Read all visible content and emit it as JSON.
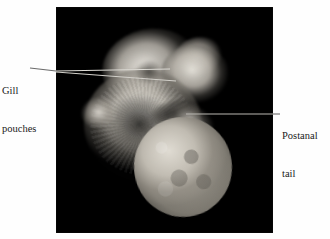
{
  "figure": {
    "background_color": "#fefefe",
    "panel": {
      "name": "embryo-photograph",
      "background_color": "#000000",
      "subject": "vertebrate embryo specimen",
      "description": "C-shaped embryo with head and brain vesicles at upper right, curved trunk with somites at left, and large rounded yolk sac at lower right"
    }
  },
  "labels": [
    {
      "id": "gill-pouches",
      "line1": "Gill",
      "line2": "pouches",
      "position": "left",
      "leader_count": 2
    },
    {
      "id": "postanal-tail",
      "line1": "Postanal",
      "line2": "tail",
      "position": "right",
      "leader_count": 1
    }
  ],
  "colors": {
    "panel_background": "#000000",
    "page_background": "#fefefe",
    "label_text": "#1a1a1a",
    "leader_line": "#d8d6d0",
    "leader_line_outside": "#6a6a6a",
    "specimen_highlight": "#ece9e2",
    "specimen_midtone": "#b9b4a9",
    "specimen_shadow": "#2c2a27"
  }
}
